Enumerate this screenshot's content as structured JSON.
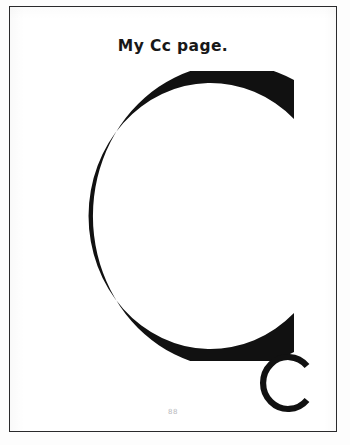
{
  "page": {
    "title": "My Cc page.",
    "page_number": "88",
    "background_color": "#ffffff",
    "border_color": "#2a2a2c",
    "ink_color": "#111111"
  },
  "letters": {
    "uppercase": {
      "character": "C",
      "label": "large-uppercase-letter-c",
      "stroke_color": "#111111",
      "stroke_width_px": 25
    },
    "lowercase": {
      "character": "c",
      "label": "small-lowercase-letter-c",
      "stroke_color": "#111111",
      "stroke_width_px": 6
    }
  }
}
